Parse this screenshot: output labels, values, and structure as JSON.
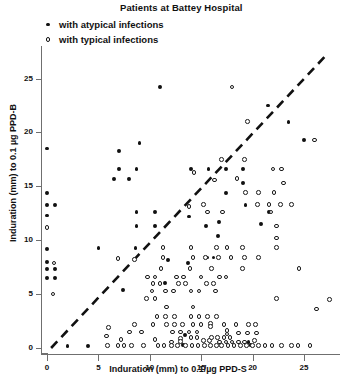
{
  "chart_data": {
    "type": "scatter",
    "title": "Patients at Battey Hospital",
    "xlabel": "Induration (mm) to 0.1/µg PPD-S",
    "ylabel": "Induration (mm) to 0.1 µg PPD-B",
    "xlim": [
      -0.7,
      28.5
    ],
    "ylim": [
      -0.7,
      27.5
    ],
    "xticks": [
      0,
      5,
      10,
      15,
      20,
      25
    ],
    "yticks": [
      0,
      5,
      10,
      15,
      20,
      25
    ],
    "grid": false,
    "legend_position": "top-left",
    "annotations": [
      {
        "type": "line",
        "style": "dashed",
        "desc": "identity line y = x",
        "from": [
          0.4,
          0
        ],
        "to": [
          27.0,
          27.0
        ]
      }
    ],
    "series": [
      {
        "name": "with atypical infections",
        "marker": "filled-circle",
        "color": "#111111",
        "points": [
          [
            0,
            18.5
          ],
          [
            0,
            14.4
          ],
          [
            0,
            13.3
          ],
          [
            0.8,
            13.3
          ],
          [
            0,
            12.3
          ],
          [
            0,
            9.2
          ],
          [
            0,
            8.0
          ],
          [
            0,
            7.3
          ],
          [
            0.8,
            7.3
          ],
          [
            0,
            6.5
          ],
          [
            0.8,
            6.5
          ],
          [
            11,
            24.2
          ],
          [
            9,
            19.0
          ],
          [
            7,
            18.3
          ],
          [
            7,
            16.6
          ],
          [
            8.7,
            16.6
          ],
          [
            6.5,
            15.7
          ],
          [
            8.0,
            15.7
          ],
          [
            14,
            16.6
          ],
          [
            15.7,
            16.6
          ],
          [
            17.4,
            16.6
          ],
          [
            19.1,
            16.6
          ],
          [
            19.1,
            15.3
          ],
          [
            17.4,
            14.4
          ],
          [
            19.3,
            13.3
          ],
          [
            21.6,
            12.6
          ],
          [
            23.5,
            21.0
          ],
          [
            25.0,
            19.3
          ],
          [
            21.5,
            22.5
          ],
          [
            8.7,
            12.6
          ],
          [
            10.5,
            12.6
          ],
          [
            8.7,
            11.3
          ],
          [
            10.5,
            11.3
          ],
          [
            13.8,
            12.2
          ],
          [
            15.5,
            11.3
          ],
          [
            16.7,
            11.7
          ],
          [
            20.8,
            11.5
          ],
          [
            16.6,
            10.4
          ],
          [
            5.0,
            9.3
          ],
          [
            8.6,
            9.3
          ],
          [
            13.7,
            7.9
          ],
          [
            11.8,
            8.2
          ],
          [
            15.6,
            8.4
          ],
          [
            16.2,
            8.4
          ],
          [
            11.5,
            6.0
          ],
          [
            7.4,
            5.4
          ],
          [
            13.4,
            1.2
          ],
          [
            19.6,
            0.55
          ],
          [
            2.0,
            0.2
          ],
          [
            4.0,
            0.2
          ],
          [
            13.2,
            0.25
          ],
          [
            19.8,
            0.25
          ]
        ]
      },
      {
        "name": "with typical infections",
        "marker": "open-circle",
        "color": "#1a1a1a",
        "points": [
          [
            0,
            11.2
          ],
          [
            0.7,
            7.9
          ],
          [
            18.0,
            24.2
          ],
          [
            19.5,
            21.0
          ],
          [
            26.0,
            19.3
          ],
          [
            17.0,
            17.5
          ],
          [
            19.2,
            17.5
          ],
          [
            22.0,
            16.6
          ],
          [
            22.8,
            16.6
          ],
          [
            18.5,
            15.7
          ],
          [
            23.0,
            15.3
          ],
          [
            19.3,
            14.4
          ],
          [
            20.6,
            14.4
          ],
          [
            22.1,
            14.4
          ],
          [
            14.3,
            16.3
          ],
          [
            16.3,
            15.6
          ],
          [
            20.5,
            13.3
          ],
          [
            21.6,
            13.3
          ],
          [
            22.7,
            13.3
          ],
          [
            23.8,
            13.3
          ],
          [
            15.6,
            12.6
          ],
          [
            17.1,
            12.6
          ],
          [
            21.8,
            12.6
          ],
          [
            13.8,
            13.1
          ],
          [
            15.2,
            13.3
          ],
          [
            22.3,
            11.3
          ],
          [
            22.3,
            10.2
          ],
          [
            22.3,
            9.3
          ],
          [
            11.3,
            9.3
          ],
          [
            14.0,
            9.3
          ],
          [
            16.5,
            9.3
          ],
          [
            17.5,
            9.3
          ],
          [
            19.0,
            9.3
          ],
          [
            11.3,
            8.4
          ],
          [
            14.2,
            8.4
          ],
          [
            15.4,
            8.4
          ],
          [
            16.7,
            8.4
          ],
          [
            17.9,
            8.4
          ],
          [
            19.2,
            8.4
          ],
          [
            20.6,
            8.4
          ],
          [
            6.9,
            8.3
          ],
          [
            8.5,
            8.2
          ],
          [
            11.1,
            7.4
          ],
          [
            13.9,
            7.4
          ],
          [
            16.0,
            7.4
          ],
          [
            19.0,
            7.4
          ],
          [
            24.5,
            7.4
          ],
          [
            9.8,
            6.6
          ],
          [
            10.5,
            6.6
          ],
          [
            12.6,
            6.6
          ],
          [
            13.3,
            6.6
          ],
          [
            15.0,
            6.6
          ],
          [
            16.8,
            6.6
          ],
          [
            17.4,
            6.6
          ],
          [
            10.3,
            6.0
          ],
          [
            11.0,
            6.0
          ],
          [
            12.8,
            6.0
          ],
          [
            13.5,
            6.0
          ],
          [
            15.5,
            6.0
          ],
          [
            16.2,
            6.0
          ],
          [
            10.2,
            5.3
          ],
          [
            11.5,
            5.3
          ],
          [
            12.3,
            5.3
          ],
          [
            14.0,
            5.3
          ],
          [
            14.8,
            5.3
          ],
          [
            16.4,
            5.3
          ],
          [
            0.6,
            5.0
          ],
          [
            9.7,
            4.6
          ],
          [
            10.5,
            4.6
          ],
          [
            22.3,
            4.6
          ],
          [
            27.5,
            4.5
          ],
          [
            11.6,
            3.8
          ],
          [
            14.2,
            3.8
          ],
          [
            26.2,
            3.6
          ],
          [
            10.7,
            2.9
          ],
          [
            11.5,
            2.9
          ],
          [
            12.4,
            2.9
          ],
          [
            14.0,
            2.9
          ],
          [
            14.8,
            2.9
          ],
          [
            15.6,
            2.9
          ],
          [
            16.5,
            2.9
          ],
          [
            8.5,
            2.2
          ],
          [
            10.3,
            2.2
          ],
          [
            11.6,
            2.2
          ],
          [
            12.4,
            2.2
          ],
          [
            13.2,
            2.2
          ],
          [
            14.2,
            2.2
          ],
          [
            15.0,
            2.2
          ],
          [
            15.9,
            2.3
          ],
          [
            15.9,
            2.0
          ],
          [
            17.2,
            2.2
          ],
          [
            18.4,
            2.2
          ],
          [
            19.6,
            2.2
          ],
          [
            20.3,
            2.2
          ],
          [
            6.0,
            1.9
          ],
          [
            8.0,
            1.5
          ],
          [
            9.2,
            1.5
          ],
          [
            12.2,
            1.5
          ],
          [
            13.0,
            1.5
          ],
          [
            13.8,
            1.5
          ],
          [
            14.6,
            1.5
          ],
          [
            17.5,
            1.6
          ],
          [
            17.5,
            1.3
          ],
          [
            18.6,
            1.4
          ],
          [
            19.5,
            1.4
          ],
          [
            20.4,
            1.4
          ],
          [
            5.8,
            1.1
          ],
          [
            7.2,
            0.8
          ],
          [
            10.5,
            0.8
          ],
          [
            5.9,
            0.25
          ],
          [
            6.9,
            0.25
          ],
          [
            7.5,
            0.25
          ],
          [
            8.2,
            0.25
          ],
          [
            9.4,
            0.25
          ],
          [
            10.8,
            0.25
          ],
          [
            11.4,
            0.25
          ],
          [
            12.1,
            0.55
          ],
          [
            12.1,
            0.25
          ],
          [
            12.7,
            0.25
          ],
          [
            13.0,
            0.9
          ],
          [
            13.0,
            0.6
          ],
          [
            13.5,
            0.25
          ],
          [
            14.1,
            0.25
          ],
          [
            14.7,
            0.25
          ],
          [
            15.3,
            0.25
          ],
          [
            15.9,
            0.25
          ],
          [
            16.5,
            0.25
          ],
          [
            14.0,
            1.0
          ],
          [
            14.6,
            1.0
          ],
          [
            15.2,
            0.7
          ],
          [
            15.8,
            0.7
          ],
          [
            16.0,
            1.0
          ],
          [
            16.6,
            1.0
          ],
          [
            17.2,
            1.0
          ],
          [
            17.8,
            1.0
          ],
          [
            16.8,
            0.55
          ],
          [
            17.4,
            0.55
          ],
          [
            18.0,
            0.55
          ],
          [
            18.6,
            0.55
          ],
          [
            19.2,
            0.55
          ],
          [
            17.0,
            0.25
          ],
          [
            17.6,
            0.25
          ],
          [
            18.2,
            0.25
          ],
          [
            18.8,
            0.25
          ],
          [
            19.4,
            0.25
          ],
          [
            20.0,
            0.25
          ],
          [
            20.6,
            0.25
          ],
          [
            20.2,
            0.7
          ],
          [
            21.2,
            0.25
          ],
          [
            21.9,
            0.25
          ],
          [
            22.8,
            0.25
          ],
          [
            23.8,
            0.25
          ],
          [
            24.4,
            0.25
          ],
          [
            25.6,
            0.25
          ]
        ]
      }
    ]
  },
  "figure": {
    "title": "Patients at Battey Hospital",
    "legend": [
      {
        "marker": "filled-circle",
        "label": "with atypical infections"
      },
      {
        "marker": "open-circle",
        "label": "with typical infections"
      }
    ],
    "xlabel": "Induration (mm) to 0.1/µg PPD-S",
    "ylabel": "Induration (mm) to 0.1 µg PPD-B",
    "xtick_labels": [
      "0",
      "5",
      "10",
      "15",
      "20",
      "25"
    ],
    "ytick_labels": [
      "0",
      "5",
      "10",
      "15",
      "20",
      "25"
    ],
    "axis_color": "#6f6f6f",
    "marker_color": "#111111",
    "reference_line_color": "#111111"
  }
}
